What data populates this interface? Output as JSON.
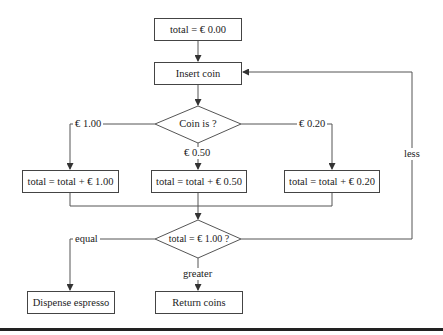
{
  "diagram": {
    "nodes": {
      "init": "total = € 0.00",
      "insert": "Insert coin",
      "coin_decision": "Coin is ?",
      "add_100": "total = total + € 1.00",
      "add_050": "total = total + € 0.50",
      "add_020": "total = total + € 0.20",
      "total_decision": "total = € 1.00 ?",
      "dispense": "Dispense espresso",
      "return": "Return coins"
    },
    "edge_labels": {
      "coin_100": "€ 1.00",
      "coin_050": "€ 0.50",
      "coin_020": "€ 0.20",
      "equal": "equal",
      "greater": "greater",
      "less": "less"
    },
    "colors": {
      "line": "#444444",
      "background": "#ffffff",
      "rule": "#222222"
    }
  }
}
